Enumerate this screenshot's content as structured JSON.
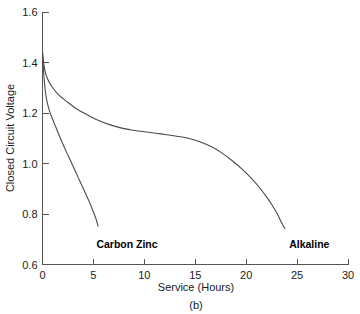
{
  "chart_data": {
    "type": "line",
    "title": "",
    "caption": "(b)",
    "xlabel": "Service (Hours)",
    "ylabel": "Closed Circuit Voltage",
    "xlim": [
      0,
      30
    ],
    "ylim": [
      0.6,
      1.6
    ],
    "xticks": [
      0,
      5,
      10,
      15,
      20,
      25,
      30
    ],
    "xtick_labels": [
      "0",
      "5",
      "10",
      "15",
      "20",
      "25",
      "30"
    ],
    "yticks": [
      0.6,
      0.8,
      1.0,
      1.2,
      1.4,
      1.6
    ],
    "ytick_labels": [
      "0.6",
      "0.8",
      "1.0",
      "1.2",
      "1.4",
      "1.6"
    ],
    "grid": false,
    "legend_position": "inline-annotation",
    "line_color": "#4a4a4a",
    "axis_color": "#555555",
    "series": [
      {
        "name": "Carbon Zinc",
        "label_x": 8.3,
        "label_y": 0.665,
        "points": [
          [
            0.0,
            1.44
          ],
          [
            0.15,
            1.34
          ],
          [
            0.3,
            1.28
          ],
          [
            0.5,
            1.235
          ],
          [
            0.8,
            1.195
          ],
          [
            1.2,
            1.155
          ],
          [
            1.7,
            1.105
          ],
          [
            2.3,
            1.05
          ],
          [
            2.9,
            0.998
          ],
          [
            3.5,
            0.945
          ],
          [
            4.1,
            0.893
          ],
          [
            4.6,
            0.848
          ],
          [
            5.0,
            0.808
          ],
          [
            5.3,
            0.775
          ],
          [
            5.45,
            0.752
          ]
        ]
      },
      {
        "name": "Alkaline",
        "label_x": 26.2,
        "label_y": 0.665,
        "points": [
          [
            0.0,
            1.44
          ],
          [
            0.2,
            1.375
          ],
          [
            0.5,
            1.335
          ],
          [
            1.0,
            1.3
          ],
          [
            1.6,
            1.272
          ],
          [
            2.4,
            1.245
          ],
          [
            3.3,
            1.218
          ],
          [
            4.3,
            1.195
          ],
          [
            5.4,
            1.172
          ],
          [
            6.5,
            1.155
          ],
          [
            7.6,
            1.142
          ],
          [
            8.6,
            1.134
          ],
          [
            9.6,
            1.128
          ],
          [
            10.8,
            1.122
          ],
          [
            12.0,
            1.115
          ],
          [
            13.2,
            1.108
          ],
          [
            14.4,
            1.099
          ],
          [
            15.5,
            1.085
          ],
          [
            16.6,
            1.066
          ],
          [
            17.6,
            1.042
          ],
          [
            18.6,
            1.012
          ],
          [
            19.6,
            0.978
          ],
          [
            20.5,
            0.942
          ],
          [
            21.3,
            0.905
          ],
          [
            22.0,
            0.868
          ],
          [
            22.6,
            0.832
          ],
          [
            23.1,
            0.797
          ],
          [
            23.5,
            0.764
          ],
          [
            23.8,
            0.742
          ]
        ]
      }
    ]
  }
}
